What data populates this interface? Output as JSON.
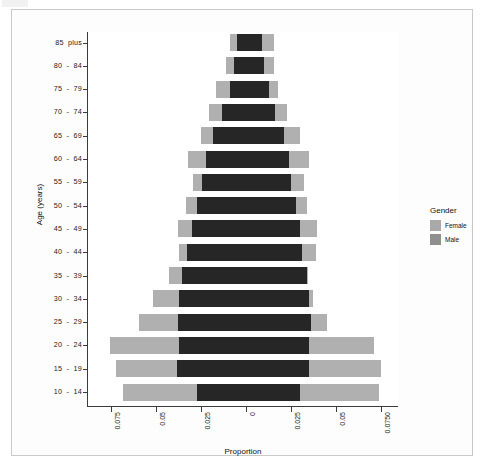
{
  "figure": {
    "x_axis_title": "Proportion",
    "y_axis_title": "Age (years)"
  },
  "legend": {
    "title": "Gender",
    "items": [
      {
        "label": "Female",
        "color": "#a9a9a9"
      },
      {
        "label": "Male",
        "color": "#8f8f8f"
      }
    ]
  },
  "axis": {
    "x_ticks": [
      "0.075",
      "0.05",
      "0.025",
      "0",
      "0.025",
      "0.05",
      "0.0750"
    ],
    "y_ticks": [
      "85  plus",
      "80  -  84",
      "75  -  79",
      "70  -  74",
      "65  -  69",
      "60  -  64",
      "55  -  59",
      "50  -  54",
      "45  -  49",
      "40  -  44",
      "35  -  39",
      "30  -  34",
      "25  -  29",
      "20  -  24",
      "15  -  19",
      "10  -  14"
    ]
  },
  "chart_data": {
    "type": "bar",
    "title": "",
    "subtitle": "",
    "xlabel": "Proportion",
    "ylabel": "Age (years)",
    "orientation": "horizontal",
    "layout": "population-pyramid-overlaid",
    "grid": false,
    "legend_position": "right",
    "xlim": [
      -0.0945,
      0.0945
    ],
    "xtick_values": [
      -0.075,
      -0.05,
      -0.025,
      0,
      0.025,
      0.05,
      0.075
    ],
    "xtick_labels": [
      "0.075",
      "0.05",
      "0.025",
      "0",
      "0.025",
      "0.05",
      "0.0750"
    ],
    "categories": [
      "85 plus",
      "80 - 84",
      "75 - 79",
      "70 - 74",
      "65 - 69",
      "60 - 64",
      "55 - 59",
      "50 - 54",
      "45 - 49",
      "40 - 44",
      "35 - 39",
      "30 - 34",
      "25 - 29",
      "20 - 24",
      "15 - 19",
      "10 - 14"
    ],
    "note": "Left side values are plotted toward negative x (female extent left), right side toward positive x. Male bars are drawn over female bars producing a darker overlap band.",
    "series": [
      {
        "name": "Female",
        "color": "#b0b0b0",
        "left_extent": [
          0.0089,
          0.0111,
          0.0167,
          0.0206,
          0.025,
          0.0322,
          0.0294,
          0.0333,
          0.0378,
          0.0372,
          0.0428,
          0.0517,
          0.0594,
          0.0756,
          0.0722,
          0.0683
        ],
        "right_extent": [
          0.0156,
          0.0156,
          0.0178,
          0.0228,
          0.03,
          0.035,
          0.0322,
          0.0339,
          0.0394,
          0.0389,
          0.0344,
          0.0372,
          0.045,
          0.0711,
          0.075,
          0.0739
        ]
      },
      {
        "name": "Male",
        "color": "#262626",
        "left_extent": [
          0.005,
          0.0067,
          0.0089,
          0.0133,
          0.0183,
          0.0222,
          0.0244,
          0.0272,
          0.03,
          0.0328,
          0.0356,
          0.0372,
          0.0378,
          0.0372,
          0.0383,
          0.0272
        ],
        "right_extent": [
          0.0089,
          0.01,
          0.0128,
          0.0161,
          0.0211,
          0.0239,
          0.025,
          0.0278,
          0.03,
          0.0311,
          0.0339,
          0.035,
          0.0361,
          0.035,
          0.035,
          0.03
        ]
      }
    ]
  }
}
